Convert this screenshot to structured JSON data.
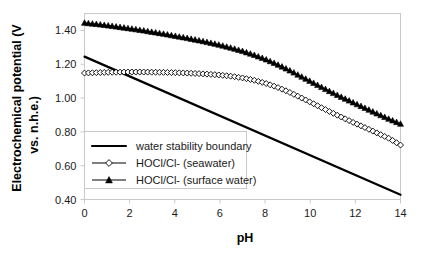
{
  "chart_data": {
    "type": "line",
    "title": "",
    "xlabel": "pH",
    "ylabel": "Electrochemical potential (V vs. n.h.e.)",
    "ylabel_line1": "Electrochemical potential (V",
    "ylabel_line2": "vs. n.h.e.)",
    "xlim": [
      0,
      14
    ],
    "ylim": [
      0.4,
      1.5
    ],
    "xticks": [
      0,
      2,
      4,
      6,
      8,
      10,
      12,
      14
    ],
    "xtick_labels": [
      "0",
      "2",
      "4",
      "6",
      "8",
      "10",
      "12",
      "14"
    ],
    "yticks": [
      0.4,
      0.6,
      0.8,
      1.0,
      1.2,
      1.4
    ],
    "ytick_labels": [
      "0.40",
      "0.60",
      "0.80",
      "1.00",
      "1.20",
      "1.40"
    ],
    "grid": false,
    "legend_position": "lower-left-inside",
    "series": [
      {
        "name": "water stability boundary",
        "marker": "none",
        "style": "solid-thick",
        "color": "#000000",
        "x": [
          0,
          14
        ],
        "values": [
          1.245,
          0.428
        ]
      },
      {
        "name": "HOCl/Cl- (seawater)",
        "marker": "open-diamond",
        "style": "line-with-markers",
        "color": "#000000",
        "x": [
          0,
          0.5,
          1,
          1.5,
          2,
          2.5,
          3,
          3.5,
          4,
          4.5,
          5,
          5.5,
          6,
          6.5,
          7,
          7.5,
          8,
          8.5,
          9,
          9.5,
          10,
          10.5,
          11,
          11.5,
          12,
          12.5,
          13,
          13.5,
          14
        ],
        "values": [
          1.148,
          1.15,
          1.152,
          1.153,
          1.154,
          1.154,
          1.153,
          1.152,
          1.15,
          1.148,
          1.145,
          1.141,
          1.136,
          1.129,
          1.119,
          1.106,
          1.088,
          1.066,
          1.039,
          1.008,
          0.976,
          0.943,
          0.911,
          0.88,
          0.85,
          0.821,
          0.791,
          0.761,
          0.722
        ]
      },
      {
        "name": "HOCl/Cl- (surface water)",
        "marker": "filled-triangle",
        "style": "line-with-markers",
        "color": "#000000",
        "x": [
          0,
          0.5,
          1,
          1.5,
          2,
          2.5,
          3,
          3.5,
          4,
          4.5,
          5,
          5.5,
          6,
          6.5,
          7,
          7.5,
          8,
          8.5,
          9,
          9.5,
          10,
          10.5,
          11,
          11.5,
          12,
          12.5,
          13,
          13.5,
          14
        ],
        "values": [
          1.445,
          1.438,
          1.43,
          1.421,
          1.412,
          1.402,
          1.391,
          1.38,
          1.368,
          1.356,
          1.343,
          1.329,
          1.314,
          1.297,
          1.278,
          1.256,
          1.231,
          1.202,
          1.17,
          1.135,
          1.1,
          1.065,
          1.031,
          0.999,
          0.968,
          0.937,
          0.906,
          0.876,
          0.848
        ]
      }
    ],
    "legend": [
      {
        "label": "water stability boundary",
        "marker": "none",
        "swatch": "thick-line"
      },
      {
        "label": "HOCl/Cl- (seawater)",
        "marker": "open-diamond",
        "swatch": "line-marker"
      },
      {
        "label": "HOCl/Cl- (surface water)",
        "marker": "filled-triangle",
        "swatch": "line-marker"
      }
    ],
    "colors": {
      "foreground": "#000000",
      "axis": "#c9c9c9",
      "background": "#ffffff"
    }
  }
}
